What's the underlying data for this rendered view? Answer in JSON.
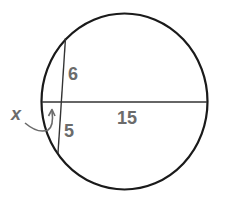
{
  "diagram": {
    "type": "intersecting-chords-in-circle",
    "labels": {
      "upper_segment": "6",
      "lower_segment": "5",
      "right_segment": "15",
      "unknown": "x"
    },
    "colors": {
      "stroke": "#1a1a1a",
      "label": "#6b6b6b",
      "background": "#ffffff"
    }
  }
}
